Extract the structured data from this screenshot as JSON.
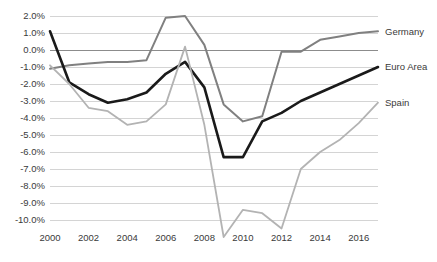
{
  "chart_data": {
    "type": "line",
    "title": "",
    "xlabel": "",
    "ylabel": "",
    "x": [
      2000,
      2001,
      2002,
      2003,
      2004,
      2005,
      2006,
      2007,
      2008,
      2009,
      2010,
      2011,
      2012,
      2013,
      2014,
      2015,
      2016,
      2017
    ],
    "xlim": [
      2000,
      2017
    ],
    "ylim": [
      -11.3,
      2.0
    ],
    "xticks": [
      2000,
      2002,
      2004,
      2006,
      2008,
      2010,
      2012,
      2014,
      2016
    ],
    "xtick_labels": [
      "2000",
      "2002",
      "2004",
      "2006",
      "2008",
      "2010",
      "2012",
      "2014",
      "2016"
    ],
    "yticks": [
      2.0,
      1.0,
      0.0,
      -1.0,
      -2.0,
      -3.0,
      -4.0,
      -5.0,
      -6.0,
      -7.0,
      -8.0,
      -9.0,
      -10.0
    ],
    "ytick_labels": [
      "2.0%",
      "1.0%",
      "0.0%",
      "-1.0%",
      "-2.0%",
      "-3.0%",
      "-4.0%",
      "-5.0%",
      "-6.0%",
      "-7.0%",
      "-8.0%",
      "-9.0%",
      "-10.0%"
    ],
    "grid": true,
    "legend_position": "right-inline",
    "series": [
      {
        "name": "Germany",
        "color": "#808080",
        "width": 2.0,
        "label_value": 1.1,
        "values": [
          -1.1,
          -0.9,
          -0.8,
          -0.7,
          -0.7,
          -0.6,
          1.9,
          2.0,
          0.3,
          -3.2,
          -4.2,
          -3.9,
          -0.1,
          -0.1,
          0.6,
          0.8,
          1.0,
          1.1
        ]
      },
      {
        "name": "Euro Area",
        "color": "#1a1a1a",
        "width": 2.6,
        "label_value": -1.0,
        "values": [
          1.1,
          -1.9,
          -2.6,
          -3.1,
          -2.9,
          -2.5,
          -1.4,
          -0.7,
          -2.2,
          -6.3,
          -6.3,
          -4.2,
          -3.7,
          -3.0,
          -2.5,
          -2.0,
          -1.5,
          -1.0
        ]
      },
      {
        "name": "Spain",
        "color": "#b3b3b3",
        "width": 1.8,
        "label_value": -3.1,
        "values": [
          -0.9,
          -2.0,
          -3.4,
          -3.6,
          -4.4,
          -4.2,
          -3.2,
          0.2,
          -4.4,
          -11.0,
          -9.4,
          -9.6,
          -10.5,
          -7.0,
          -6.0,
          -5.3,
          -4.3,
          -3.1
        ]
      }
    ]
  },
  "axes": {
    "y_axis_name": "deficit-percent-axis",
    "x_axis_name": "year-axis"
  }
}
